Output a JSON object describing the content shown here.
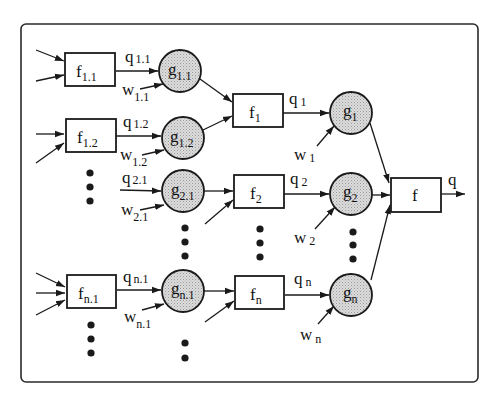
{
  "diagram": {
    "colors": {
      "ink": "#1a1a1a",
      "node_fill": "#d4d4d4",
      "background": "#ffffff"
    },
    "first_level_blocks": [
      {
        "id": "f11",
        "name": "f",
        "sub": "1.1"
      },
      {
        "id": "f12",
        "name": "f",
        "sub": "1.2"
      },
      {
        "id": "fn1",
        "name": "f",
        "sub": "n.1"
      }
    ],
    "first_level_nodes": [
      {
        "id": "g11",
        "name": "g",
        "sub": "1.1",
        "q": {
          "name": "q",
          "sub": "1.1"
        },
        "w": {
          "name": "w",
          "sub": "1.1"
        }
      },
      {
        "id": "g12",
        "name": "g",
        "sub": "1.2",
        "q": {
          "name": "q",
          "sub": "1.2"
        },
        "w": {
          "name": "w",
          "sub": "1.2"
        }
      },
      {
        "id": "g21",
        "name": "g",
        "sub": "2.1",
        "q": {
          "name": "q",
          "sub": "2.1"
        },
        "w": {
          "name": "w",
          "sub": "2.1"
        }
      },
      {
        "id": "gn1",
        "name": "g",
        "sub": "n.1",
        "q": {
          "name": "q",
          "sub": "n.1"
        },
        "w": {
          "name": "w",
          "sub": "n.1"
        }
      }
    ],
    "second_level_blocks": [
      {
        "id": "f1",
        "name": "f",
        "sub": "1"
      },
      {
        "id": "f2",
        "name": "f",
        "sub": "2"
      },
      {
        "id": "fn",
        "name": "f",
        "sub": "n"
      }
    ],
    "second_level_nodes": [
      {
        "id": "g1",
        "name": "g",
        "sub": "1",
        "q": {
          "name": "q",
          "sub": "1"
        },
        "w": {
          "name": "w",
          "sub": "1"
        }
      },
      {
        "id": "g2",
        "name": "g",
        "sub": "2",
        "q": {
          "name": "q",
          "sub": "2"
        },
        "w": {
          "name": "w",
          "sub": "2"
        }
      },
      {
        "id": "gn",
        "name": "g",
        "sub": "n",
        "q": {
          "name": "q",
          "sub": "n"
        },
        "w": {
          "name": "w",
          "sub": "n"
        }
      }
    ],
    "output_block": {
      "name": "f"
    },
    "output_label": "q",
    "edges": [
      [
        "f11",
        "g11"
      ],
      [
        "f12",
        "g12"
      ],
      [
        "fn1",
        "gn1"
      ],
      [
        "g11",
        "f1"
      ],
      [
        "g12",
        "f1"
      ],
      [
        "g21",
        "f2"
      ],
      [
        "gn1",
        "fn"
      ],
      [
        "f1",
        "g1"
      ],
      [
        "f2",
        "g2"
      ],
      [
        "fn",
        "gn"
      ],
      [
        "g1",
        "f"
      ],
      [
        "g2",
        "f"
      ],
      [
        "gn",
        "f"
      ]
    ]
  }
}
